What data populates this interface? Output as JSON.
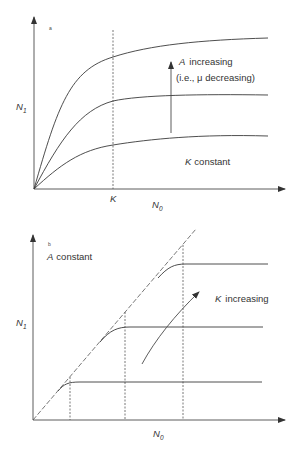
{
  "panel_a": {
    "panel_label": "a",
    "y_axis_label": "N",
    "y_axis_sub": "1",
    "x_axis_label": "N",
    "x_axis_sub": "0",
    "k_tick_label": "K",
    "annotation_line1_var": "A",
    "annotation_line1_text": "increasing",
    "annotation_line2": "(i.e., μ decreasing)",
    "bottom_note_var": "K",
    "bottom_note_text": "constant"
  },
  "panel_b": {
    "panel_label": "b",
    "note_var": "A",
    "note_text": "constant",
    "y_axis_label": "N",
    "y_axis_sub": "1",
    "x_axis_label": "N",
    "x_axis_sub": "0",
    "arrow_var": "K",
    "arrow_text": "increasing"
  },
  "colors": {
    "line": "#3a3a3a",
    "background": "#ffffff"
  }
}
